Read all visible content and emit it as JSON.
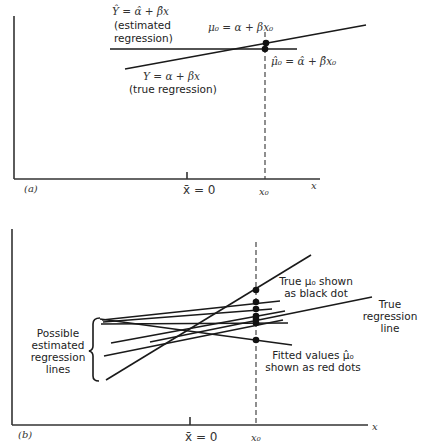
{
  "panel_a": {
    "label": "(a)",
    "x_axis_label": "x",
    "xbar_label": "x̄ = 0",
    "x0_label": "x₀",
    "estimated_eq": "Ŷ = α̂ + β̂x",
    "estimated_caption_1": "(estimated",
    "estimated_caption_2": "regression)",
    "true_eq": "Y = α + βx",
    "true_caption": "(true regression)",
    "mu0_eq": "μ₀ = α + βx₀",
    "muhat0_eq": "μ̂₀ = α̂ + β̂x₀"
  },
  "panel_b": {
    "label": "(b)",
    "x_axis_label": "x",
    "xbar_label": "x̄ = 0",
    "x0_label": "x₀",
    "bracket_caption": [
      "Possible",
      "estimated",
      "regression",
      "lines"
    ],
    "true_mu_caption": [
      "True μ₀ shown",
      "as black dot"
    ],
    "true_line_caption": [
      "True",
      "regression",
      "line"
    ],
    "fitted_caption": [
      "Fitted values μ̂₀",
      "shown as red dots"
    ]
  },
  "colors": {
    "line": "#1a1a1a",
    "axis": "#333333",
    "background": "#ffffff"
  }
}
